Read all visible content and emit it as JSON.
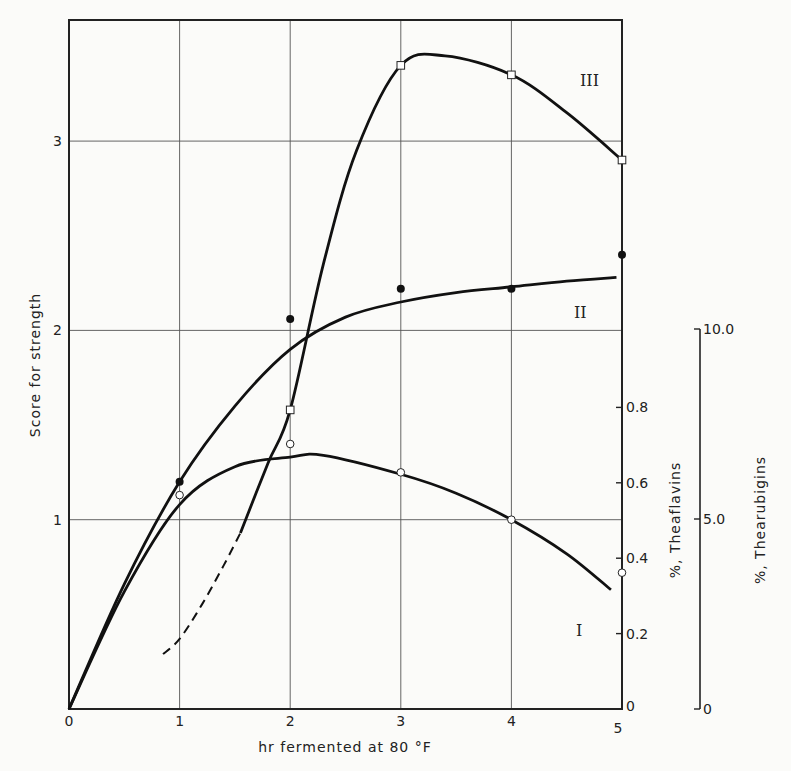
{
  "chart_data": {
    "type": "line",
    "title": "",
    "xlabel": "hr fermented at 80 °F",
    "ylabel": "Score for strength",
    "xlim": [
      0,
      5
    ],
    "ylim": [
      0,
      3.65
    ],
    "x_ticks": [
      "0",
      "1",
      "2",
      "3",
      "4",
      "5"
    ],
    "y_ticks": [
      "1",
      "2",
      "3"
    ],
    "grid": true,
    "secondary_axes": [
      {
        "label": "%,  Theaflavins",
        "range": [
          0,
          0.9
        ],
        "ticks": [
          "0",
          "0.2",
          "0.4",
          "0.6",
          "0.8"
        ]
      },
      {
        "label": "%,  Thearubigins",
        "range": [
          0,
          10.0
        ],
        "ticks": [
          "0",
          "5.0",
          "10.0"
        ]
      }
    ],
    "series": [
      {
        "name": "I",
        "marker": "open-circle",
        "x": [
          1,
          2,
          3,
          4,
          5
        ],
        "values": [
          1.13,
          1.4,
          1.25,
          1.0,
          0.72
        ],
        "curve": [
          [
            0,
            0
          ],
          [
            0.5,
            0.62
          ],
          [
            1,
            1.08
          ],
          [
            1.5,
            1.28
          ],
          [
            2,
            1.33
          ],
          [
            2.3,
            1.34
          ],
          [
            3,
            1.24
          ],
          [
            3.5,
            1.14
          ],
          [
            4,
            1.0
          ],
          [
            4.5,
            0.82
          ],
          [
            4.9,
            0.63
          ]
        ]
      },
      {
        "name": "II",
        "marker": "filled-circle",
        "x": [
          1,
          2,
          3,
          4,
          5
        ],
        "values": [
          1.2,
          2.06,
          2.22,
          2.22,
          2.4
        ],
        "curve": [
          [
            0,
            0
          ],
          [
            0.5,
            0.66
          ],
          [
            1,
            1.2
          ],
          [
            1.5,
            1.6
          ],
          [
            2,
            1.9
          ],
          [
            2.5,
            2.07
          ],
          [
            3,
            2.15
          ],
          [
            3.5,
            2.2
          ],
          [
            4,
            2.23
          ],
          [
            4.5,
            2.26
          ],
          [
            4.95,
            2.28
          ]
        ]
      },
      {
        "name": "III",
        "marker": "open-square",
        "x": [
          2,
          3,
          4,
          5
        ],
        "values": [
          1.58,
          3.4,
          3.35,
          2.9
        ],
        "curve": [
          [
            1.55,
            0.93
          ],
          [
            1.8,
            1.3
          ],
          [
            2,
            1.58
          ],
          [
            2.3,
            2.35
          ],
          [
            2.6,
            2.95
          ],
          [
            3,
            3.4
          ],
          [
            3.4,
            3.45
          ],
          [
            4,
            3.35
          ],
          [
            4.5,
            3.15
          ],
          [
            5,
            2.9
          ]
        ],
        "dashed_extension": [
          [
            0.85,
            0.29
          ],
          [
            1.0,
            0.37
          ],
          [
            1.2,
            0.55
          ],
          [
            1.4,
            0.76
          ],
          [
            1.55,
            0.93
          ]
        ]
      }
    ],
    "annotations": [
      {
        "text": "III",
        "x": 4.35,
        "y": 3.1
      },
      {
        "text": "II",
        "x": 4.3,
        "y": 2.03
      },
      {
        "text": "I",
        "x": 4.15,
        "y": 0.42
      }
    ]
  },
  "labels": {
    "xlabel": "hr fermented at 80 °F",
    "ylabel": "Score for strength",
    "theaflavins": "%,   Theaflavins",
    "thearubigins": "%,   Thearubigins",
    "curve_I": "I",
    "curve_II": "II",
    "curve_III": "III"
  },
  "colors": {
    "ink": "#111111",
    "grid": "#555555",
    "paper": "#fbfbf9"
  }
}
